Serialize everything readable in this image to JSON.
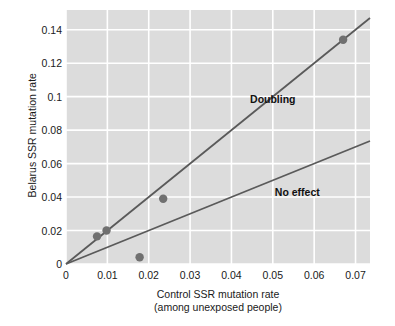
{
  "chart_data": {
    "type": "scatter",
    "title": "",
    "xlabel": "Control SSR mutation rate",
    "xlabel_sub": "(among unexposed people)",
    "ylabel": "Belarus SSR mutation rate",
    "xlim": [
      0,
      0.0735
    ],
    "ylim": [
      0,
      0.1518
    ],
    "xticks": [
      0,
      0.01,
      0.02,
      0.03,
      0.04,
      0.05,
      0.06,
      0.07
    ],
    "xtick_labels": [
      "0",
      "0.01",
      "0.02",
      "0.03",
      "0.04",
      "0.05",
      "0.06",
      "0.07"
    ],
    "yticks": [
      0,
      0.02,
      0.04,
      0.06,
      0.08,
      0.1,
      0.12,
      0.14
    ],
    "ytick_labels": [
      "0",
      "0.02",
      "0.04",
      "0.06",
      "0.08",
      "0.1",
      "0.12",
      "0.14"
    ],
    "grid": true,
    "grid_color": "#ffffff",
    "plot_background": "#dcdcdc",
    "legend": "none",
    "points": [
      {
        "x": 0.0075,
        "y": 0.0165
      },
      {
        "x": 0.0098,
        "y": 0.02
      },
      {
        "x": 0.0178,
        "y": 0.004
      },
      {
        "x": 0.0235,
        "y": 0.039
      },
      {
        "x": 0.067,
        "y": 0.134
      }
    ],
    "point_color": "#707070",
    "point_radius": 4.2,
    "lines": [
      {
        "name": "Doubling",
        "slope": 2,
        "intercept": 0,
        "color": "#5a5a5a",
        "width": 1.8
      },
      {
        "name": "No effect",
        "slope": 1,
        "intercept": 0,
        "color": "#5a5a5a",
        "width": 1.8
      }
    ],
    "annotations": [
      {
        "text": "Doubling",
        "x": 0.0445,
        "y": 0.0985
      },
      {
        "text": "No effect",
        "x": 0.0505,
        "y": 0.0432
      }
    ]
  }
}
